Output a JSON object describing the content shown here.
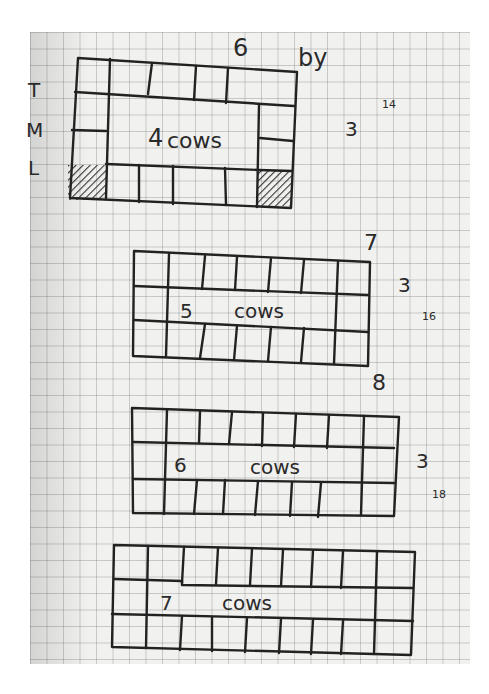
{
  "side_letters": [
    "T",
    "M",
    "L"
  ],
  "diagrams": [
    {
      "top_label": "6",
      "side_label": "3",
      "extra": "by",
      "margin_note": "14",
      "center": "4 cows",
      "count": "4",
      "word": "cows"
    },
    {
      "top_label": "7",
      "side_label": "3",
      "margin_note": "16",
      "center": "5 cows",
      "count": "5",
      "word": "cows"
    },
    {
      "top_label": "8",
      "side_label": "3",
      "margin_note": "18",
      "center": "6 cows",
      "count": "6",
      "word": "cows"
    },
    {
      "top_label": "",
      "side_label": "",
      "center": "7 cows",
      "count": "7",
      "word": "cows"
    }
  ]
}
